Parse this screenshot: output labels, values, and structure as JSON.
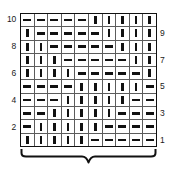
{
  "chart_data": {
    "type": "heatmap",
    "title": "",
    "subtitle": "",
    "xlabel": "",
    "ylabel": "",
    "grid": true,
    "legend_position": "none",
    "columns": 10,
    "rows": 10,
    "symbol_legend": {
      "|": "knit-stitch",
      "-": "purl-stitch"
    },
    "symbol_colors": {
      "stitch_mark": "#111111",
      "cell_border": "#5c5c5c",
      "outer_border": "#111111",
      "background": "#ffffff"
    },
    "row_order": "bottom-to-top",
    "row_numbers_left": [
      "10",
      "",
      "8",
      "",
      "6",
      "",
      "4",
      "",
      "2",
      ""
    ],
    "row_numbers_right": [
      "",
      "9",
      "",
      "7",
      "",
      "5",
      "",
      "3",
      "",
      "1"
    ],
    "rows_top_to_bottom": [
      {
        "row": 10,
        "side": "left",
        "cells": [
          "-",
          "-",
          "-",
          "-",
          "-",
          "|",
          "|",
          "|",
          "|",
          "|"
        ]
      },
      {
        "row": 9,
        "side": "right",
        "cells": [
          "|",
          "-",
          "-",
          "-",
          "-",
          "-",
          "|",
          "|",
          "|",
          "|"
        ]
      },
      {
        "row": 8,
        "side": "left",
        "cells": [
          "|",
          "|",
          "-",
          "-",
          "-",
          "-",
          "-",
          "|",
          "|",
          "|"
        ]
      },
      {
        "row": 7,
        "side": "right",
        "cells": [
          "|",
          "|",
          "|",
          "-",
          "-",
          "-",
          "-",
          "-",
          "|",
          "|"
        ]
      },
      {
        "row": 6,
        "side": "left",
        "cells": [
          "|",
          "|",
          "|",
          "|",
          "-",
          "-",
          "-",
          "-",
          "-",
          "|"
        ]
      },
      {
        "row": 5,
        "side": "right",
        "cells": [
          "-",
          "-",
          "-",
          "-",
          "|",
          "|",
          "|",
          "|",
          "|",
          "-"
        ]
      },
      {
        "row": 4,
        "side": "left",
        "cells": [
          "-",
          "-",
          "-",
          "|",
          "|",
          "|",
          "|",
          "|",
          "-",
          "-"
        ]
      },
      {
        "row": 3,
        "side": "right",
        "cells": [
          "-",
          "-",
          "|",
          "|",
          "|",
          "|",
          "|",
          "-",
          "-",
          "-"
        ]
      },
      {
        "row": 2,
        "side": "left",
        "cells": [
          "-",
          "|",
          "|",
          "|",
          "|",
          "|",
          "-",
          "-",
          "-",
          "-"
        ]
      },
      {
        "row": 1,
        "side": "right",
        "cells": [
          "|",
          "|",
          "|",
          "|",
          "|",
          "-",
          "-",
          "-",
          "-",
          "-"
        ]
      }
    ],
    "repeat_bracket": {
      "label": "",
      "spans_columns": [
        1,
        10
      ],
      "position": "below-chart"
    },
    "annotations": []
  }
}
